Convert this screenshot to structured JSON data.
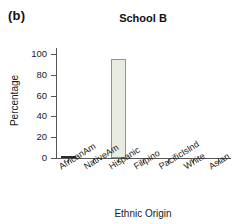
{
  "panel": {
    "label": "(b)"
  },
  "axis_titles": {
    "x": "Ethnic Origin",
    "y": "Percentage"
  },
  "chart_data": {
    "type": "bar",
    "title": "School B",
    "xlabel": "Ethnic Origin",
    "ylabel": "Percentage",
    "categories": [
      "AfricanAm",
      "NativeAm",
      "Hispanic",
      "Filipino",
      "PacificIslnd",
      "White",
      "Asian"
    ],
    "values": [
      1,
      0,
      95,
      0,
      0,
      0,
      0
    ],
    "ylim": [
      0,
      106
    ],
    "yticks": [
      0,
      20,
      40,
      60,
      80,
      100
    ],
    "ytick_labels": [
      "0",
      "20",
      "40",
      "60",
      "80",
      "100"
    ],
    "grid": false,
    "legend": false,
    "bar_fill_color": "#e7eee1",
    "bar_edge_color": "#8d968a",
    "axis_color": "#555555",
    "background_color": "#ffffff"
  }
}
